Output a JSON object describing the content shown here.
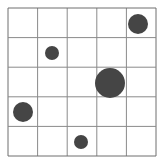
{
  "grid": {
    "rows": 5,
    "cols": 5,
    "x0": 8,
    "y0": 8,
    "cell": 29.6,
    "line_color": "#8a8a8a",
    "border_color": "#6e6e6e"
  },
  "circles": [
    {
      "row": 0,
      "col": 4,
      "cx": 138,
      "cy": 24,
      "r": 10
    },
    {
      "row": 1,
      "col": 1,
      "cx": 52,
      "cy": 53,
      "r": 7
    },
    {
      "row": 2,
      "col": 3,
      "cx": 110,
      "cy": 83,
      "r": 15
    },
    {
      "row": 3,
      "col": 0,
      "cx": 23,
      "cy": 112,
      "r": 10
    },
    {
      "row": 4,
      "col": 2,
      "cx": 81,
      "cy": 142,
      "r": 7
    }
  ],
  "circle_color": "#454545"
}
